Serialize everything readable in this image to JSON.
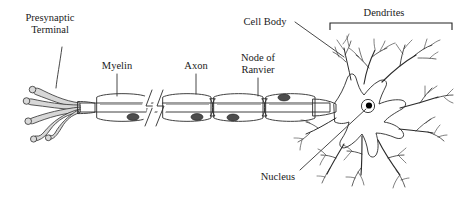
{
  "figure": {
    "width": 458,
    "height": 202,
    "background_color": "#ffffff"
  },
  "labels": {
    "presynaptic_terminal_line1": "Presynaptic",
    "presynaptic_terminal_line2": "Terminal",
    "myelin": "Myelin",
    "axon": "Axon",
    "node_of_ranvier_line1": "Node of",
    "node_of_ranvier_line2": "Ranvier",
    "cell_body": "Cell Body",
    "dendrites": "Dendrites",
    "nucleus": "Nucleus"
  },
  "colors": {
    "ink": "#2b2b2b",
    "label_text": "#1a1a1a",
    "myelin_light": "#b8b8b8",
    "myelin_dark": "#8a8a8a",
    "soma_fill": "#c3c3c3",
    "terminal_fill": "#d7d7d7",
    "nucleus_dot": "#000000",
    "nucleus_ring": "#ffffff",
    "schwann_nucleus": "#555555",
    "background": "#ffffff"
  },
  "parts": [
    {
      "id": "presynaptic-terminal",
      "label": "Presynaptic Terminal",
      "side": "left"
    },
    {
      "id": "myelin",
      "label": "Myelin",
      "side": "left-center"
    },
    {
      "id": "axon",
      "label": "Axon",
      "side": "center"
    },
    {
      "id": "node-of-ranvier",
      "label": "Node of Ranvier",
      "side": "right-center"
    },
    {
      "id": "cell-body",
      "label": "Cell Body",
      "side": "right"
    },
    {
      "id": "nucleus",
      "label": "Nucleus",
      "side": "right-bottom"
    },
    {
      "id": "dendrites",
      "label": "Dendrites",
      "side": "far-right"
    }
  ]
}
